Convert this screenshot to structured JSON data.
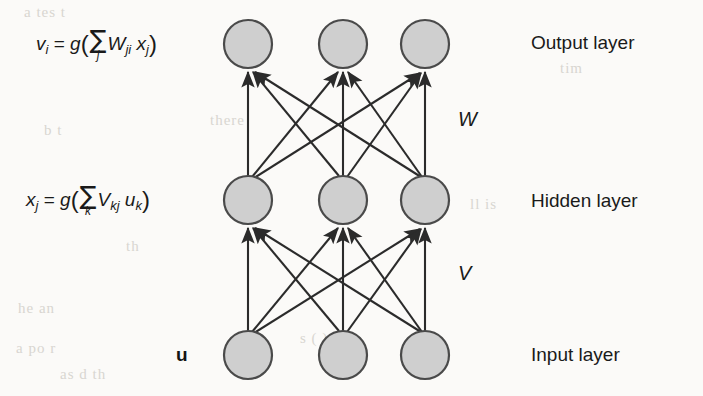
{
  "figure": {
    "background_color": "#fbfaf8",
    "node_fill_color": "#cfcfcf",
    "node_stroke_color": "#4a4a4a",
    "edge_color": "#2b2b2b"
  },
  "formulas": {
    "output": {
      "lhs_symbol": "v",
      "lhs_subscript": "i",
      "equals": "=",
      "func": "g",
      "open_paren": "(",
      "sigma": "∑",
      "sigma_index": "j",
      "weight_symbol": "W",
      "weight_subscript": "ji",
      "variable_symbol": "x",
      "variable_subscript": "j",
      "close_paren": ")",
      "plain": "v_i = g( ∑_j W_ji x_j )"
    },
    "hidden": {
      "lhs_symbol": "x",
      "lhs_subscript": "j",
      "equals": "=",
      "func": "g",
      "open_paren": "(",
      "sigma": "∑",
      "sigma_index": "k",
      "weight_symbol": "V",
      "weight_subscript": "kj",
      "variable_symbol": "u",
      "variable_subscript": "k",
      "close_paren": ")",
      "plain": "x_j = g( ∑_k V_kj u_k )"
    },
    "input_vector": "u"
  },
  "weight_labels": [
    {
      "id": "weights-w",
      "text": "W",
      "between": "hidden-to-output"
    },
    {
      "id": "weights-v",
      "text": "V",
      "between": "input-to-hidden"
    }
  ],
  "layer_labels": [
    {
      "id": "output-layer",
      "text": "Output layer"
    },
    {
      "id": "hidden-layer",
      "text": "Hidden layer"
    },
    {
      "id": "input-layer",
      "text": "Input layer"
    }
  ],
  "network": {
    "node_radius": 24,
    "columns_x": [
      248,
      343,
      425
    ],
    "rows": [
      {
        "id": "output",
        "y": 44,
        "node_count": 3
      },
      {
        "id": "hidden",
        "y": 200,
        "node_count": 3
      },
      {
        "id": "input",
        "y": 355,
        "node_count": 3
      }
    ],
    "connections": [
      {
        "id": "V",
        "from": "input",
        "to": "hidden",
        "type": "fully-connected",
        "edge_count": 9,
        "arrow_direction": "up"
      },
      {
        "id": "W",
        "from": "hidden",
        "to": "output",
        "type": "fully-connected",
        "edge_count": 9,
        "arrow_direction": "up"
      }
    ]
  },
  "scan_bleed": [
    {
      "text": "a  tes  t",
      "x": 24,
      "y": 4
    },
    {
      "text": "there",
      "x": 210,
      "y": 112
    },
    {
      "text": "b  t",
      "x": 44,
      "y": 122
    },
    {
      "text": "th",
      "x": 126,
      "y": 238
    },
    {
      "text": "he  an",
      "x": 18,
      "y": 300
    },
    {
      "text": "ll  is",
      "x": 470,
      "y": 196
    },
    {
      "text": "a  po  r",
      "x": 16,
      "y": 340
    },
    {
      "text": "as  d  th",
      "x": 60,
      "y": 366
    },
    {
      "text": "s ( ) a  is",
      "x": 300,
      "y": 330
    },
    {
      "text": "tim",
      "x": 560,
      "y": 60
    }
  ]
}
